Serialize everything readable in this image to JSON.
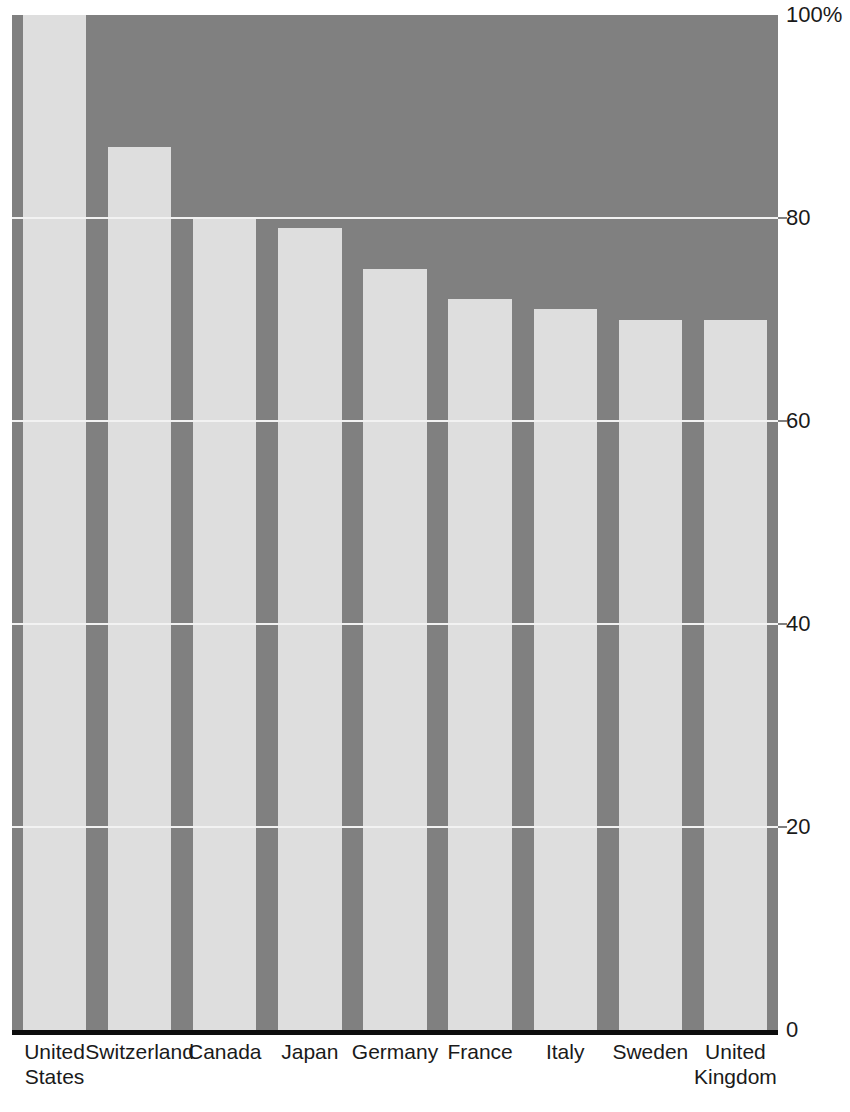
{
  "chart_data": {
    "type": "bar",
    "title": "",
    "subtitle": "",
    "xlabel": "",
    "ylabel": "",
    "ylim": [
      0,
      100
    ],
    "grid": true,
    "legend": null,
    "categories": [
      "United States",
      "Switzerland",
      "Canada",
      "Japan",
      "Germany",
      "France",
      "Italy",
      "Sweden",
      "United Kingdom"
    ],
    "category_lines": [
      [
        "United",
        "States"
      ],
      [
        "Switzerland"
      ],
      [
        "Canada"
      ],
      [
        "Japan"
      ],
      [
        "Germany"
      ],
      [
        "France"
      ],
      [
        "Italy"
      ],
      [
        "Sweden"
      ],
      [
        "United",
        "Kingdom"
      ]
    ],
    "values": [
      100,
      87,
      80,
      79,
      75,
      72,
      71,
      70,
      70
    ],
    "yticks": [
      0,
      20,
      40,
      60,
      80,
      100
    ],
    "ytick_labels": [
      "0",
      "20",
      "40",
      "60",
      "80",
      "100%"
    ]
  },
  "colors": {
    "plot_background": "#808080",
    "bar_fill": "#dedede",
    "gridline": "#f2f2f2",
    "axis_line": "#0d0d0d",
    "label_text": "#1a1a1a",
    "page_background": "#ffffff"
  }
}
